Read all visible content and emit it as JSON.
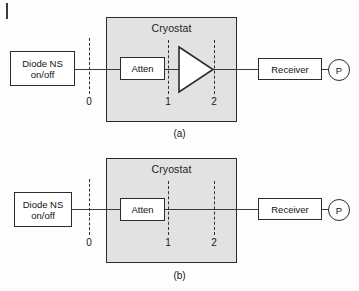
{
  "figure": {
    "background_color": "#fdfdfd",
    "cryostat_fill": "#e2e2e2",
    "line_color": "#2b2b2b"
  },
  "diagrams": [
    {
      "caption": "(a)",
      "has_amplifier": true,
      "cryostat_label": "Cryostat",
      "source_line1": "Diode NS",
      "source_line2": "on/off",
      "attenuator_label": "Atten",
      "receiver_label": "Receiver",
      "power_meter_label": "P",
      "reference_planes": [
        "0",
        "1",
        "2"
      ]
    },
    {
      "caption": "(b)",
      "has_amplifier": false,
      "cryostat_label": "Cryostat",
      "source_line1": "Diode NS",
      "source_line2": "on/off",
      "attenuator_label": "Atten",
      "receiver_label": "Receiver",
      "power_meter_label": "P",
      "reference_planes": [
        "0",
        "1",
        "2"
      ]
    }
  ]
}
